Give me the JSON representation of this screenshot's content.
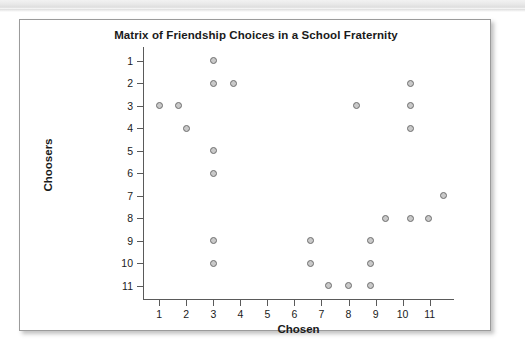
{
  "chart_data": {
    "type": "scatter",
    "title": "Matrix of Friendship Choices in a School Fraternity",
    "xlabel": "Chosen",
    "ylabel": "Choosers",
    "xlim": [
      0.4,
      11.9
    ],
    "ylim": [
      0.4,
      11.6
    ],
    "y_inverted": true,
    "grid": false,
    "legend": null,
    "xticks": [
      "1",
      "2",
      "3",
      "4",
      "5",
      "6",
      "7",
      "8",
      "9",
      "10",
      "11"
    ],
    "xtick_values": [
      1,
      2,
      3,
      4,
      5,
      6,
      7,
      8,
      9,
      10,
      11
    ],
    "yticks": [
      "1",
      "2",
      "3",
      "4",
      "5",
      "6",
      "7",
      "8",
      "9",
      "10",
      "11"
    ],
    "ytick_values": [
      1,
      2,
      3,
      4,
      5,
      6,
      7,
      8,
      9,
      10,
      11
    ],
    "marker": {
      "shape": "circle",
      "fill": "#c9c9c9",
      "edge": "#6e6e6e",
      "size": 7
    },
    "points": [
      {
        "x": 3.0,
        "y": 1
      },
      {
        "x": 3.0,
        "y": 2
      },
      {
        "x": 3.75,
        "y": 2
      },
      {
        "x": 10.3,
        "y": 2
      },
      {
        "x": 1.0,
        "y": 3
      },
      {
        "x": 1.7,
        "y": 3
      },
      {
        "x": 8.3,
        "y": 3
      },
      {
        "x": 10.3,
        "y": 3
      },
      {
        "x": 2.0,
        "y": 4
      },
      {
        "x": 10.3,
        "y": 4
      },
      {
        "x": 3.0,
        "y": 5
      },
      {
        "x": 3.0,
        "y": 6
      },
      {
        "x": 11.5,
        "y": 7
      },
      {
        "x": 9.35,
        "y": 8
      },
      {
        "x": 10.3,
        "y": 8
      },
      {
        "x": 10.95,
        "y": 8
      },
      {
        "x": 3.0,
        "y": 9
      },
      {
        "x": 6.6,
        "y": 9
      },
      {
        "x": 8.8,
        "y": 9
      },
      {
        "x": 3.0,
        "y": 10
      },
      {
        "x": 6.6,
        "y": 10
      },
      {
        "x": 8.8,
        "y": 10
      },
      {
        "x": 7.25,
        "y": 11
      },
      {
        "x": 8.0,
        "y": 11
      },
      {
        "x": 8.8,
        "y": 11
      }
    ]
  }
}
